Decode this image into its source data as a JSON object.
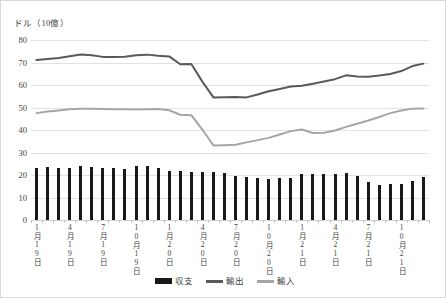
{
  "chart_data": {
    "type": "bar",
    "title": "",
    "subtitle": "",
    "unit_caption": "ドル（10億）",
    "xlabel": "",
    "ylabel": "",
    "ylim": [
      0,
      80
    ],
    "ytick_step": 10,
    "yticks": [
      "80",
      "70",
      "60",
      "50",
      "40",
      "30",
      "20",
      "10",
      "0"
    ],
    "grid": "horizontal",
    "legend_position": "bottom",
    "x": [
      "1月19日",
      "2月19日",
      "3月19日",
      "4月19日",
      "5月19日",
      "6月19日",
      "7月19日",
      "8月19日",
      "9月19日",
      "10月19日",
      "11月19日",
      "12月19日",
      "1月20日",
      "2月20日",
      "3月20日",
      "4月20日",
      "5月20日",
      "6月20日",
      "7月20日",
      "8月20日",
      "9月20日",
      "10月20日",
      "11月20日",
      "12月20日",
      "1月21日",
      "2月21日",
      "3月21日",
      "4月21日",
      "5月21日",
      "6月21日",
      "7月21日",
      "8月21日",
      "9月21日",
      "10月21日",
      "11月21日",
      "12月21日"
    ],
    "xtick_labels": [
      "1月19日",
      "4月19日",
      "7月19日",
      "10月19日",
      "1月20日",
      "4月20日",
      "7月20日",
      "10月20日",
      "1月21日",
      "4月21日",
      "7月21日",
      "10月21日"
    ],
    "xtick_indices": [
      0,
      3,
      6,
      9,
      12,
      15,
      18,
      21,
      24,
      27,
      30,
      33
    ],
    "series": [
      {
        "name": "収支",
        "type": "bar",
        "color": "#191919",
        "values": [
          23.3,
          23.6,
          23.3,
          23.3,
          24.1,
          23.5,
          23.0,
          23.1,
          22.7,
          24.0,
          24.0,
          23.3,
          22.0,
          21.6,
          21.2,
          21.2,
          21.3,
          21.0,
          19.6,
          18.9,
          18.6,
          18.1,
          18.6,
          18.6,
          20.4,
          20.5,
          20.4,
          20.4,
          20.7,
          19.6,
          16.8,
          15.6,
          15.8,
          15.9,
          17.5,
          19.2
        ]
      },
      {
        "name": "輸出",
        "type": "line",
        "color": "#595959",
        "values": [
          71.1,
          71.6,
          72.0,
          72.8,
          73.6,
          73.2,
          72.5,
          72.5,
          72.6,
          73.2,
          73.5,
          73.0,
          72.7,
          69.2,
          69.3,
          61.5,
          54.5,
          54.6,
          54.7,
          54.5,
          55.8,
          57.2,
          58.2,
          59.3,
          59.7,
          60.6,
          61.6,
          62.6,
          64.3,
          63.8,
          63.7,
          64.2,
          64.9,
          66.2,
          68.4,
          69.5
        ]
      },
      {
        "name": "輸入",
        "type": "line",
        "color": "#a6a6a6",
        "values": [
          47.5,
          48.2,
          48.7,
          49.2,
          49.4,
          49.5,
          49.3,
          49.2,
          49.2,
          49.1,
          49.2,
          49.3,
          48.8,
          46.8,
          46.6,
          40.2,
          33.1,
          33.2,
          33.4,
          34.5,
          35.5,
          36.5,
          38.0,
          39.5,
          40.2,
          38.7,
          38.8,
          39.8,
          41.4,
          42.8,
          44.2,
          45.8,
          47.5,
          48.7,
          49.5,
          49.6
        ]
      }
    ],
    "legend": [
      {
        "label": "収支",
        "marker": "bar",
        "color": "#191919"
      },
      {
        "label": "輸出",
        "marker": "line",
        "color": "#595959"
      },
      {
        "label": "輸入",
        "marker": "line",
        "color": "#a6a6a6"
      }
    ]
  }
}
